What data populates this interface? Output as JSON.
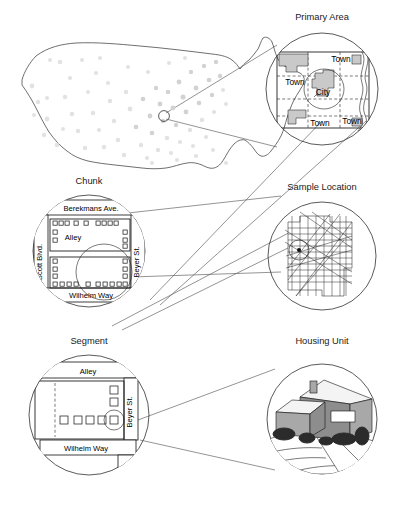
{
  "figure": {
    "title_national_map": "United States sample points map",
    "panels": [
      {
        "id": "national",
        "label": ""
      },
      {
        "id": "primary",
        "label": "Primary Area"
      },
      {
        "id": "chunk",
        "label": "Chunk"
      },
      {
        "id": "sample",
        "label": "Sample Location"
      },
      {
        "id": "segment",
        "label": "Segment"
      },
      {
        "id": "housing",
        "label": "Housing Unit"
      }
    ]
  },
  "primary_area": {
    "label": "Primary Area",
    "place_labels": [
      "Town",
      "Town",
      "City",
      "Town",
      "Town"
    ],
    "city_label": "City",
    "town_label": "Town"
  },
  "chunk": {
    "label": "Chunk",
    "streets": {
      "top": "Berekmans Ave.",
      "left": "Scott Blvd.",
      "middle": "Alley",
      "right": "Beyer St.",
      "bottom": "Wilhelm Way"
    }
  },
  "sample_location": {
    "label": "Sample Location"
  },
  "segment": {
    "label": "Segment",
    "streets": {
      "top": "Alley",
      "right": "Beyer St.",
      "bottom": "Wilhelm Way"
    }
  },
  "housing_unit": {
    "label": "Housing Unit"
  },
  "colors": {
    "ink": "#1a1a1a",
    "line": "#4a4a4a",
    "fill_gray": "#c9c9c9",
    "dot_gray": "#e2e2e2",
    "paper": "#ffffff"
  }
}
